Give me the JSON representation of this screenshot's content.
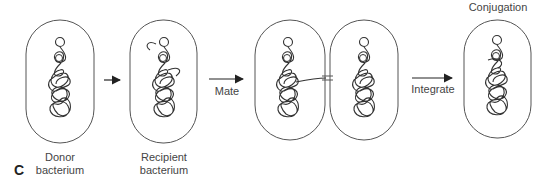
{
  "figure": {
    "panel_letter": "C",
    "title": "Conjugation",
    "cells": [
      {
        "id": "donor",
        "label_line1": "Donor",
        "label_line2": "bacterium"
      },
      {
        "id": "recipient",
        "label_line1": "Recipient",
        "label_line2": "bacterium"
      },
      {
        "id": "mating_pair_left",
        "label_line1": "",
        "label_line2": ""
      },
      {
        "id": "mating_pair_right",
        "label_line1": "",
        "label_line2": ""
      },
      {
        "id": "conjugant",
        "label_line1": "",
        "label_line2": ""
      }
    ],
    "arrows": [
      {
        "id": "arrow1",
        "label": ""
      },
      {
        "id": "arrow2",
        "label": "Mate"
      },
      {
        "id": "arrow3",
        "label": "Integrate"
      }
    ],
    "colors": {
      "outline": "#555555",
      "dna": "#333333",
      "text": "#444444"
    }
  }
}
